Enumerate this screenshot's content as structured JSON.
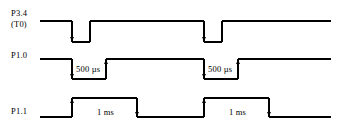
{
  "diagram": {
    "type": "timing-diagram",
    "width": 341,
    "height": 134,
    "background_color": "#ffffff",
    "line_color": "#000000",
    "signals": [
      {
        "name": "P3.4",
        "label": "P3.4",
        "sublabel": "(T0)",
        "idle_level": "high",
        "pulse_polarity": "low",
        "pulses": [
          {
            "start_x": 72,
            "end_x": 90
          },
          {
            "start_x": 204,
            "end_x": 222
          }
        ],
        "annotation": ""
      },
      {
        "name": "P1.0",
        "label": "P1.0",
        "sublabel": "",
        "idle_level": "high",
        "pulse_polarity": "low",
        "pulses": [
          {
            "start_x": 72,
            "end_x": 106
          },
          {
            "start_x": 204,
            "end_x": 238
          }
        ],
        "annotation": "500 µs"
      },
      {
        "name": "P1.1",
        "label": "P1.1",
        "sublabel": "",
        "idle_level": "low",
        "pulse_polarity": "high",
        "pulses": [
          {
            "start_x": 72,
            "end_x": 137
          },
          {
            "start_x": 204,
            "end_x": 269
          }
        ],
        "annotation": "1 ms"
      }
    ],
    "annotations": [
      {
        "text": "500 µs",
        "signal": "P1.0",
        "instance": 1
      },
      {
        "text": "500 µs",
        "signal": "P1.0",
        "instance": 2
      },
      {
        "text": "1 ms",
        "signal": "P1.1",
        "instance": 1
      },
      {
        "text": "1 ms",
        "signal": "P1.1",
        "instance": 2
      }
    ],
    "edge_markers": {
      "shape": "arrowhead",
      "count": 12,
      "description": "small filled arrowheads marking signal transition edges"
    }
  }
}
